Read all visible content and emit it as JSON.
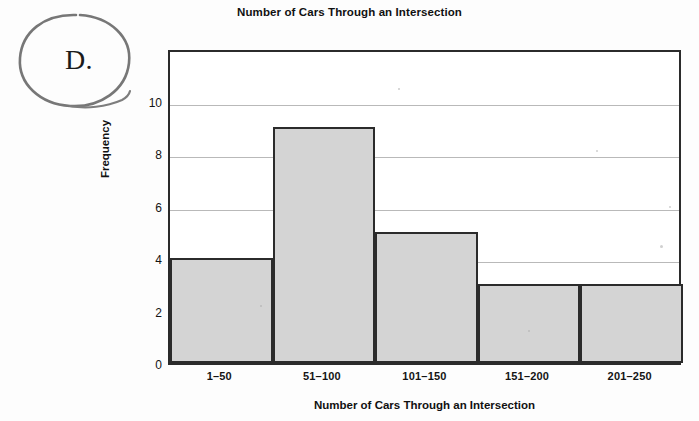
{
  "annotation": {
    "option_letter": "D.",
    "marker_shape": "hand-drawn-circle"
  },
  "chart_data": {
    "type": "bar",
    "title": "Number of Cars Through an Intersection",
    "xlabel": "Number of Cars Through an Intersection",
    "ylabel": "Frequency",
    "categories": [
      "1–50",
      "51–100",
      "101–150",
      "151–200",
      "201–250"
    ],
    "values": [
      4,
      9,
      5,
      3,
      3
    ],
    "ylim": [
      0,
      12
    ],
    "yticks": [
      0,
      2,
      4,
      6,
      8,
      10
    ],
    "ytick_labels": [
      "0",
      "2",
      "4",
      "6",
      "8",
      "10"
    ],
    "grid": "horizontal",
    "legend": "none",
    "bar_fill_color": "#d4d4d4",
    "bar_edge_color": "#2b2b2b",
    "gridline_color": "#b9b9b9",
    "background_color": "#ffffff"
  }
}
